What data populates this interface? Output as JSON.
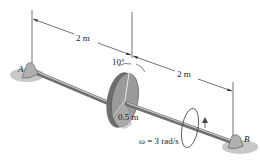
{
  "figure": {
    "type": "engineering-dynamics-diagram",
    "labels": {
      "support_a": "A",
      "support_b": "B",
      "dim_left": "2 m",
      "dim_right": "2 m",
      "tilt_angle": "10°",
      "disk_radius": "0.5 m",
      "angular_velocity": "ω = 3 rad/s"
    },
    "colors": {
      "shaft": "#8a8a8a",
      "shaft_highlight": "#d0d0d0",
      "disk_face": "#9a9a9a",
      "disk_edge": "#6e6e6e",
      "ground_shadow": "#c8c8c8",
      "support": "#b0b0b0",
      "dimension_line": "#333333"
    }
  }
}
